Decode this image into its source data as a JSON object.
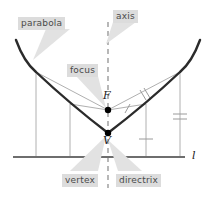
{
  "figure": {
    "colors": {
      "curve": "#2b2b2b",
      "directrix": "#6e6e6e",
      "axis_dashed": "#9a9a9a",
      "thin_line": "#b0b0b0",
      "label_bg": "#dcdcdc",
      "label_text": "#4a4a4a",
      "math_text": "#1a1a1a",
      "callout_fill": "#e2e2e2",
      "point_fill": "#000000"
    },
    "callouts": [
      {
        "id": "parabola",
        "label": "parabola",
        "x": 18,
        "y": 17
      },
      {
        "id": "axis",
        "label": "axis",
        "x": 113,
        "y": 10
      },
      {
        "id": "focus",
        "label": "focus",
        "x": 67,
        "y": 64
      },
      {
        "id": "vertex",
        "label": "vertex",
        "x": 62,
        "y": 174
      },
      {
        "id": "directrix",
        "label": "directrix",
        "x": 116,
        "y": 174
      }
    ],
    "math_labels": [
      {
        "id": "focus-point-label",
        "label": "F",
        "x": 103,
        "y": 90
      },
      {
        "id": "vertex-point-label",
        "label": "V",
        "x": 103,
        "y": 135
      },
      {
        "id": "directrix-line-label",
        "label": "l",
        "x": 192,
        "y": 150
      }
    ],
    "points": [
      {
        "id": "focus-point",
        "label": "F",
        "cx": 108,
        "cy": 110
      },
      {
        "id": "vertex-point",
        "label": "V",
        "cx": 108,
        "cy": 133
      }
    ],
    "tick_marks": [
      {
        "id": "focus-to-upper-right-point-ticks",
        "count": 2
      },
      {
        "id": "focus-to-lower-right-point-tick",
        "count": 1
      },
      {
        "id": "upper-right-drop-ticks",
        "count": 2
      },
      {
        "id": "lower-right-drop-tick",
        "count": 1
      }
    ],
    "geometry": {
      "directrix_y": 157,
      "directrix_x1": 13,
      "directrix_x2": 185,
      "axis_x": 108,
      "vertex_y": 133,
      "focus_y": 110
    }
  }
}
